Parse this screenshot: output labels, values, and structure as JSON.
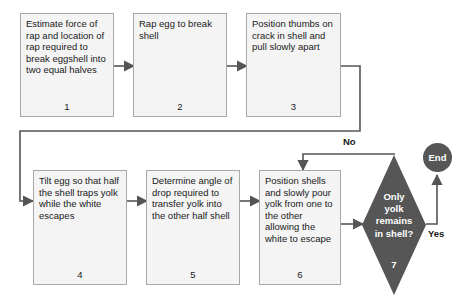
{
  "diagram": {
    "colors": {
      "box_fill": "#f4f4f4",
      "box_border": "#a8a8a8",
      "decision_fill": "#565656",
      "terminator_fill": "#565656",
      "connector": "#555555",
      "text": "#1a1a1a",
      "inverse_text": "#ffffff"
    },
    "nodes": [
      {
        "id": "step1",
        "shape": "process",
        "number": "1",
        "text": "Estimate force of rap and location of rap required to break eggshell into two equal halves"
      },
      {
        "id": "step2",
        "shape": "process",
        "number": "2",
        "text": "Rap egg to break shell"
      },
      {
        "id": "step3",
        "shape": "process",
        "number": "3",
        "text": "Position thumbs on crack in shell and pull slowly apart"
      },
      {
        "id": "step4",
        "shape": "process",
        "number": "4",
        "text": "Tilt egg so that half the shell traps yolk while the white escapes"
      },
      {
        "id": "step5",
        "shape": "process",
        "number": "5",
        "text": "Determine angle of drop required to transfer yolk into the other half shell"
      },
      {
        "id": "step6",
        "shape": "process",
        "number": "6",
        "text": "Position shells and slowly pour yolk from one to the other allowing the white to escape"
      },
      {
        "id": "step7",
        "shape": "decision",
        "number": "7",
        "text": "Only\nyolk\nremains\nin shell?"
      },
      {
        "id": "end",
        "shape": "terminator",
        "text": "End"
      }
    ],
    "edge_labels": {
      "no": "No",
      "yes": "Yes"
    }
  }
}
